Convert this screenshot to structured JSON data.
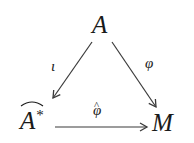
{
  "diagram": {
    "type": "commutative-triangle",
    "nodes": {
      "top": {
        "id": "A",
        "text": "A"
      },
      "bottom_left": {
        "id": "A_hat_star",
        "text": "A",
        "superscript": "*",
        "decoration": "wide-hat"
      },
      "bottom_right": {
        "id": "M",
        "text": "M"
      }
    },
    "edges": [
      {
        "from": "A",
        "to": "A_hat_star",
        "label": "ι"
      },
      {
        "from": "A",
        "to": "M",
        "label": "φ"
      },
      {
        "from": "A_hat_star",
        "to": "M",
        "label": "φ",
        "label_decoration": "hat"
      }
    ],
    "hat_glyph": "^",
    "colors": {
      "stroke": "#3a3a3a",
      "text": "#1a1a1a",
      "background": "#ffffff"
    }
  }
}
